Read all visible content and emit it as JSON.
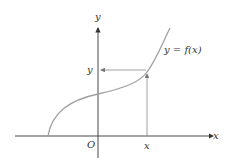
{
  "diagram": {
    "labels": {
      "y_axis": "y",
      "x_axis": "x",
      "origin": "O",
      "y_value": "y",
      "x_value": "x",
      "curve": "y = f(x)"
    },
    "colors": {
      "curve": "#a0a0a0",
      "axes": "#333333",
      "guide": "#808080"
    }
  }
}
